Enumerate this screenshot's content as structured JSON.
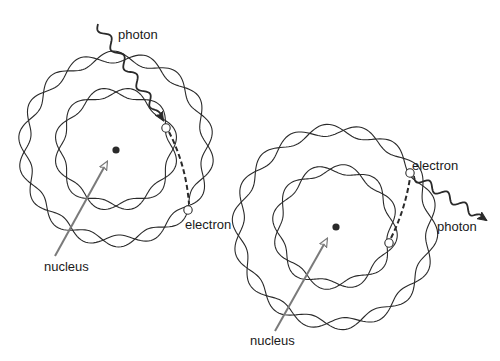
{
  "diagram": {
    "title": "",
    "panels": [
      {
        "id": "absorption",
        "labels": {
          "photon": "photon",
          "electron": "electron",
          "nucleus": "nucleus"
        }
      },
      {
        "id": "emission",
        "labels": {
          "photon": "photon",
          "electron": "electron",
          "nucleus": "nucleus"
        }
      }
    ]
  },
  "colors": {
    "background": "#ffffff",
    "line": "#2a2a2a",
    "arrow": "#7a7a7a",
    "text": "#1a1a1a"
  }
}
